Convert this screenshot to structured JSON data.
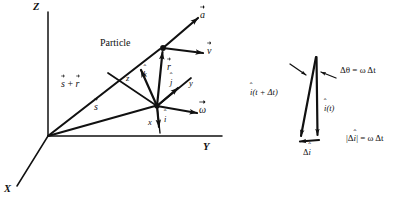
{
  "figure": {
    "background_color": "#ffffff",
    "ink_color": "#111111"
  },
  "left_diagram": {
    "name": "global-frame-diagram",
    "axes": [
      {
        "id": "z-axis",
        "label": "Z",
        "direction": "up"
      },
      {
        "id": "y-axis",
        "label": "Y",
        "direction": "right"
      },
      {
        "id": "x-axis",
        "label": "X",
        "direction": "down-left"
      }
    ],
    "origin_label": "",
    "particle_label": "Particle",
    "vectors": [
      {
        "id": "s-plus-r",
        "label": "s + r",
        "symbol": "s⃗ + r⃗",
        "from": "origin",
        "to": "particle"
      },
      {
        "id": "s",
        "label": "s",
        "symbol": "s⃗",
        "from": "origin",
        "to": "moving-frame-origin"
      },
      {
        "id": "r",
        "label": "r",
        "symbol": "r⃗",
        "from": "moving-frame-origin",
        "to": "particle"
      },
      {
        "id": "a",
        "label": "a",
        "symbol": "a⃗",
        "from": "particle",
        "direction": "up-right"
      },
      {
        "id": "v",
        "label": "v",
        "symbol": "v⃗",
        "from": "particle",
        "direction": "right"
      },
      {
        "id": "omega",
        "label": "ω",
        "symbol": "ω⃗",
        "from": "moving-frame-origin",
        "direction": "down-right"
      }
    ],
    "local_frame": {
      "name": "moving-frame",
      "unit_vectors": [
        {
          "id": "i-hat",
          "symbol": "i",
          "hat": true,
          "axis_label": "x",
          "direction": "down"
        },
        {
          "id": "j-hat",
          "symbol": "j",
          "hat": true,
          "axis_label": "y",
          "direction": "up-right"
        },
        {
          "id": "k-hat",
          "symbol": "k",
          "hat": true,
          "axis_label": "z",
          "direction": "up-left"
        }
      ]
    }
  },
  "right_diagram": {
    "name": "unit-vector-rotation-diagram",
    "vectors": [
      {
        "id": "i-hat-t",
        "label": "i(t)",
        "symbol": "î(t)"
      },
      {
        "id": "i-hat-t-plus-dt",
        "label": "i(t + Δt)",
        "symbol": "î(t + Δt)"
      },
      {
        "id": "delta-i-hat",
        "label": "Δi",
        "symbol": "Δî"
      }
    ],
    "annotations": [
      {
        "id": "delta-theta-equation",
        "text": "Δθ = ω Δt"
      },
      {
        "id": "delta-i-magnitude-equation",
        "text": "|Δî| = ω Δt"
      }
    ]
  },
  "labels": {
    "axis_z": "Z",
    "axis_y": "Y",
    "axis_x": "X",
    "particle": "Particle",
    "s_plus_r": "s",
    "s_plus_r_tail": "+",
    "s_plus_r_second": "r",
    "s": "s",
    "r": "r",
    "a": "a",
    "v": "v",
    "omega": "ω",
    "local_x": "x",
    "local_y": "y",
    "local_z": "z",
    "i_hat": "i",
    "j_hat": "j",
    "k_hat": "k",
    "hat_mark": "ˆ",
    "i_of_t": "(t)",
    "i_of_t_plus_dt": "(t + Δt)",
    "delta": "Δ",
    "delta_theta_eq": "Δθ = ω Δt",
    "delta_i_mag_eq_open": "|",
    "delta_i_mag_eq_close": "| = ω Δt"
  }
}
